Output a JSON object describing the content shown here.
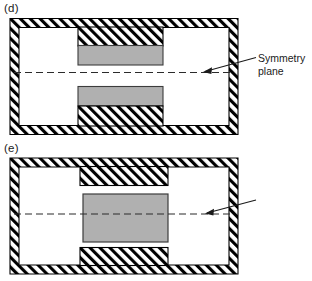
{
  "figure": {
    "type": "engineering-cross-section-diagram",
    "colors": {
      "background": "#ffffff",
      "outline": "#000000",
      "hatch": "#000000",
      "gray_block": "#b0b0b0",
      "gray_block_border": "#3c3c3c",
      "dashed_line": "#2b2b2b",
      "text": "#1a1a1a"
    }
  },
  "panels": [
    {
      "id": "d",
      "label": "(d)",
      "callout": {
        "line1": "Symmetry",
        "line2": "plane"
      },
      "geometry": {
        "frame": {
          "x": 10,
          "y": 18,
          "width": 228,
          "height": 116,
          "wall_thickness": 9
        },
        "symmetry_plane_y": 72,
        "blocks": [
          {
            "name": "top-hatched-pedestal",
            "fill": "hatch",
            "x": 78,
            "y": 27,
            "width": 85,
            "height": 18
          },
          {
            "name": "top-gray-block",
            "fill": "gray",
            "x": 78,
            "y": 45,
            "width": 85,
            "height": 19
          },
          {
            "name": "bottom-gray-block",
            "fill": "gray",
            "x": 78,
            "y": 86,
            "width": 85,
            "height": 19
          },
          {
            "name": "bottom-hatched-pedestal",
            "fill": "hatch",
            "x": 78,
            "y": 105,
            "width": 85,
            "height": 20
          }
        ]
      }
    },
    {
      "id": "e",
      "label": "(e)",
      "callout": {
        "line1": "Symmetry",
        "line2": "plane"
      },
      "geometry": {
        "frame": {
          "x": 10,
          "y": 18,
          "width": 228,
          "height": 116,
          "wall_thickness": 9
        },
        "symmetry_plane_y": 74,
        "blocks": [
          {
            "name": "top-hatched-pedestal",
            "fill": "hatch",
            "x": 80,
            "y": 27,
            "width": 88,
            "height": 18
          },
          {
            "name": "center-gray-block",
            "fill": "gray",
            "x": 83,
            "y": 54,
            "width": 85,
            "height": 48
          },
          {
            "name": "bottom-hatched-pedestal",
            "fill": "hatch",
            "x": 80,
            "y": 108,
            "width": 88,
            "height": 17
          }
        ]
      }
    }
  ]
}
